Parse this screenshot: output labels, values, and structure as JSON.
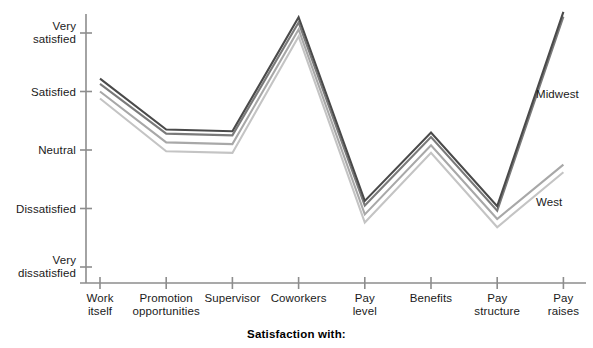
{
  "chart_data": {
    "type": "line",
    "title": "",
    "xlabel": "Satisfaction with:",
    "ylabel": "",
    "grid": false,
    "legend_position": "inline-right",
    "categories": [
      "Work itself",
      "Promotion opportunities",
      "Supervisor",
      "Coworkers",
      "Pay level",
      "Benefits",
      "Pay structure",
      "Pay raises"
    ],
    "category_lines": [
      [
        "Work",
        "itself"
      ],
      [
        "Promotion",
        "opportunities"
      ],
      [
        "Supervisor",
        ""
      ],
      [
        "Coworkers",
        ""
      ],
      [
        "Pay",
        "level"
      ],
      [
        "Benefits",
        ""
      ],
      [
        "Pay",
        "structure"
      ],
      [
        "Pay",
        "raises"
      ]
    ],
    "ytick_labels": [
      [
        "Very",
        "satisfied"
      ],
      [
        "Satisfied",
        ""
      ],
      [
        "Neutral",
        ""
      ],
      [
        "Dissatisfied",
        ""
      ],
      [
        "Very",
        "dissatisfied"
      ]
    ],
    "ytick_values": [
      5,
      4,
      3,
      2,
      1
    ],
    "ylim": [
      1,
      5
    ],
    "series": [
      {
        "name": "Midwest",
        "color": "#4a4a4a",
        "values": [
          4.22,
          3.35,
          3.32,
          5.27,
          2.13,
          3.3,
          2.04,
          5.36
        ]
      },
      {
        "name": "Series 2",
        "color": "#7a7a7a",
        "values": [
          4.13,
          3.28,
          3.25,
          5.18,
          2.05,
          3.22,
          1.96,
          5.28
        ]
      },
      {
        "name": "Series 3",
        "color": "#a8a8a8",
        "values": [
          4.0,
          3.13,
          3.1,
          5.06,
          1.9,
          3.08,
          1.82,
          2.75
        ]
      },
      {
        "name": "West",
        "color": "#c4c4c4",
        "values": [
          3.88,
          2.98,
          2.95,
          4.94,
          1.76,
          2.95,
          1.68,
          2.62
        ]
      }
    ],
    "annotations": [
      {
        "name": "Midwest",
        "text": "Midwest"
      },
      {
        "name": "West",
        "text": "West"
      }
    ]
  },
  "axis": {
    "x_title": "Satisfaction with:"
  }
}
